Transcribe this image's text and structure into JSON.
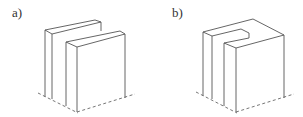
{
  "figures": [
    {
      "label": "a)",
      "description": "Two parallel vertical slabs (separated rectangular blocks) in isometric view"
    },
    {
      "label": "b)",
      "description": "Block with a U-shaped slot cut from the top, in isometric view"
    }
  ],
  "colors": {
    "line": "#555555",
    "background": "#ffffff"
  }
}
